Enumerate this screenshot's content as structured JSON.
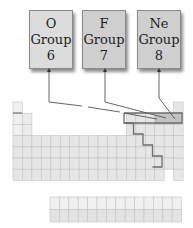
{
  "group_boxes": [
    {
      "element": "O",
      "label": "Group",
      "number": "6",
      "fill": "#dcdcdc"
    },
    {
      "element": "F",
      "label": "Group",
      "number": "7",
      "fill": "#cfcfcf"
    },
    {
      "element": "Ne",
      "label": "Group",
      "number": "8",
      "fill": "#cfcfcf"
    }
  ],
  "colors": {
    "cell_fill": "#e6e6e6",
    "cell_border": "#c4c4c4",
    "highlight_fill": "#c2c2c2",
    "outline": "#6e6e6e",
    "arrow": "#555555"
  },
  "periodic_table": {
    "periods": 7,
    "groups": 18,
    "lanthanide_row_cells": 14,
    "actinide_row_cells": 14,
    "highlighted_cells": [
      "O",
      "F",
      "Ne"
    ]
  }
}
